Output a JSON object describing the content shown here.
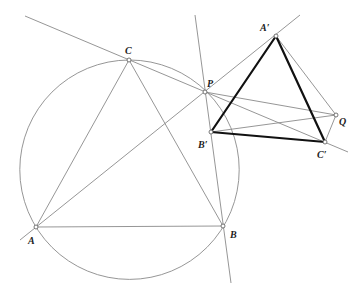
{
  "diagram": {
    "title": "",
    "points": {
      "A": {
        "label": "A",
        "x": 36,
        "y": 227
      },
      "B": {
        "label": "B",
        "x": 223,
        "y": 226
      },
      "C": {
        "label": "C",
        "x": 129,
        "y": 60
      },
      "P": {
        "label": "P",
        "x": 205,
        "y": 92
      },
      "A_prime": {
        "label": "A′",
        "x": 276,
        "y": 36
      },
      "B_prime": {
        "label": "B′",
        "x": 211,
        "y": 132
      },
      "C_prime": {
        "label": "C′",
        "x": 325,
        "y": 142
      },
      "Q": {
        "label": "Q",
        "x": 336,
        "y": 115
      }
    },
    "circle": {
      "cx": 129.5,
      "cy": 169.7,
      "r": 109.7
    },
    "colors": {
      "thin_line": "#8a8a8a",
      "thick_line": "#111111",
      "background": "#ffffff"
    }
  }
}
